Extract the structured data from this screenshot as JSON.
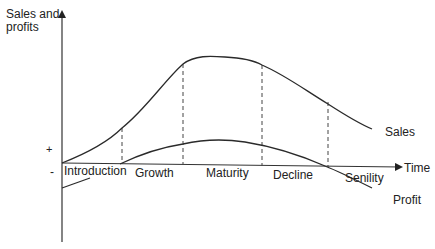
{
  "diagram": {
    "y_axis_label": "Sales and profits",
    "y_axis_label_lines": [
      "Sales and",
      "profits"
    ],
    "x_axis_label": "Time",
    "plus_sign": "+",
    "minus_sign": "-",
    "stages": [
      "Introduction",
      "Growth",
      "Maturity",
      "Decline",
      "Senility"
    ],
    "curves": [
      {
        "name": "Sales",
        "label": "Sales"
      },
      {
        "name": "Profit",
        "label": "Profit"
      }
    ],
    "colors": {
      "line": "#2a2a2a",
      "background": "#ffffff"
    }
  }
}
